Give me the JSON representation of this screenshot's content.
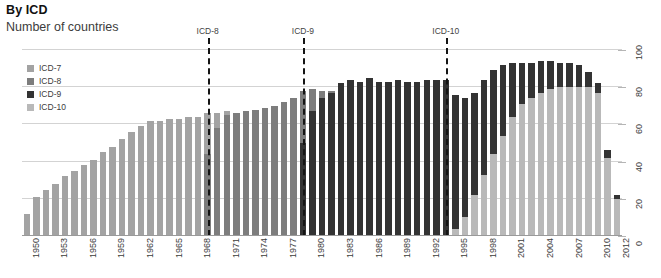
{
  "header": {
    "title": "By ICD",
    "subtitle": "Number of countries"
  },
  "legend": {
    "items": [
      {
        "label": "ICD-7",
        "color": "#a3a3a3"
      },
      {
        "label": "ICD-8",
        "color": "#7d7d7d"
      },
      {
        "label": "ICD-9",
        "color": "#333333"
      },
      {
        "label": "ICD-10",
        "color": "#b9b9b9"
      }
    ]
  },
  "annotations": [
    {
      "label": "ICD-8",
      "year": 1969
    },
    {
      "label": "ICD-9",
      "year": 1979
    },
    {
      "label": "ICD-10",
      "year": 1994
    }
  ],
  "axis": {
    "y_ticks": [
      "0",
      "20",
      "40",
      "60",
      "80",
      "100"
    ],
    "x_ticks": [
      "1950",
      "1953",
      "1956",
      "1959",
      "1962",
      "1965",
      "1968",
      "1971",
      "1974",
      "1977",
      "1980",
      "1983",
      "1986",
      "1989",
      "1992",
      "1995",
      "1998",
      "2001",
      "2004",
      "2007",
      "2010",
      "2012"
    ]
  },
  "chart_data": {
    "type": "bar",
    "stacked": true,
    "title": "By ICD",
    "subtitle": "Number of countries",
    "xlabel": "",
    "ylabel": "Number of countries",
    "ylim": [
      0,
      100
    ],
    "grid": true,
    "legend_position": "top-left-inside",
    "categories": [
      1950,
      1951,
      1952,
      1953,
      1954,
      1955,
      1956,
      1957,
      1958,
      1959,
      1960,
      1961,
      1962,
      1963,
      1964,
      1965,
      1966,
      1967,
      1968,
      1969,
      1970,
      1971,
      1972,
      1973,
      1974,
      1975,
      1976,
      1977,
      1978,
      1979,
      1980,
      1981,
      1982,
      1983,
      1984,
      1985,
      1986,
      1987,
      1988,
      1989,
      1990,
      1991,
      1992,
      1993,
      1994,
      1995,
      1996,
      1997,
      1998,
      1999,
      2000,
      2001,
      2002,
      2003,
      2004,
      2005,
      2006,
      2007,
      2008,
      2009,
      2010,
      2011,
      2012
    ],
    "series": [
      {
        "name": "ICD-7",
        "color": "#a3a3a3",
        "values": [
          12,
          21,
          25,
          28,
          32,
          35,
          38,
          41,
          45,
          48,
          52,
          56,
          59,
          62,
          62,
          63,
          63,
          64,
          64,
          22,
          8,
          2,
          0,
          0,
          0,
          0,
          0,
          0,
          0,
          0,
          0,
          0,
          0,
          0,
          0,
          0,
          0,
          0,
          0,
          0,
          0,
          0,
          0,
          0,
          0,
          0,
          0,
          0,
          0,
          0,
          0,
          0,
          0,
          0,
          0,
          0,
          0,
          0,
          0,
          0,
          0,
          0,
          0
        ]
      },
      {
        "name": "ICD-8",
        "color": "#7d7d7d",
        "values": [
          0,
          0,
          0,
          0,
          0,
          0,
          0,
          0,
          0,
          0,
          0,
          0,
          0,
          0,
          0,
          0,
          0,
          0,
          0,
          44,
          58,
          65,
          66,
          67,
          68,
          69,
          70,
          72,
          74,
          28,
          12,
          4,
          1,
          0,
          0,
          0,
          0,
          0,
          0,
          0,
          0,
          0,
          0,
          0,
          0,
          0,
          0,
          0,
          0,
          0,
          0,
          0,
          0,
          0,
          0,
          0,
          0,
          0,
          0,
          0,
          0,
          0,
          0
        ]
      },
      {
        "name": "ICD-9",
        "color": "#333333",
        "values": [
          0,
          0,
          0,
          0,
          0,
          0,
          0,
          0,
          0,
          0,
          0,
          0,
          0,
          0,
          0,
          0,
          0,
          0,
          0,
          0,
          0,
          0,
          0,
          0,
          0,
          0,
          0,
          0,
          0,
          50,
          67,
          74,
          77,
          82,
          84,
          83,
          85,
          83,
          83,
          84,
          83,
          83,
          84,
          84,
          84,
          72,
          64,
          55,
          51,
          45,
          38,
          29,
          22,
          19,
          17,
          15,
          13,
          13,
          12,
          8,
          5,
          4,
          2
        ]
      },
      {
        "name": "ICD-10",
        "color": "#b9b9b9",
        "values": [
          0,
          0,
          0,
          0,
          0,
          0,
          0,
          0,
          0,
          0,
          0,
          0,
          0,
          0,
          0,
          0,
          0,
          0,
          0,
          0,
          0,
          0,
          0,
          0,
          0,
          0,
          0,
          0,
          0,
          0,
          0,
          0,
          0,
          0,
          0,
          0,
          0,
          0,
          0,
          0,
          0,
          0,
          0,
          0,
          0,
          4,
          10,
          22,
          33,
          44,
          54,
          64,
          71,
          74,
          77,
          79,
          80,
          80,
          80,
          80,
          77,
          42,
          20
        ]
      }
    ]
  }
}
